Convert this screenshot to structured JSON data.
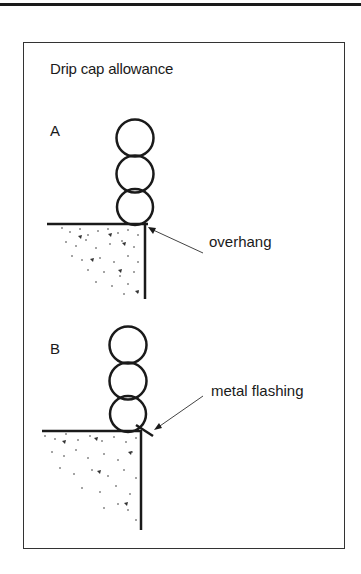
{
  "figure": {
    "title": "Drip cap allowance",
    "panels": [
      {
        "id": "A",
        "label": "A",
        "callout": "overhang"
      },
      {
        "id": "B",
        "label": "B",
        "callout": "metal flashing"
      }
    ]
  },
  "colors": {
    "ink": "#1a1a1a",
    "background": "#ffffff"
  }
}
